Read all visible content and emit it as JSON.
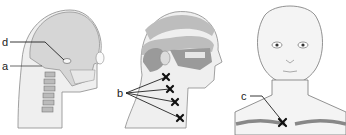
{
  "figure": {
    "panels": [
      {
        "id": "skull-lateral",
        "description": "Lateral view of head with skull and cervical spine",
        "labels": [
          {
            "text": "d",
            "target": "temporomandibular joint"
          },
          {
            "text": "a",
            "target": "occipital / upper cervical region"
          }
        ]
      },
      {
        "id": "head-lateral-pain",
        "description": "Lateral view of head with shaded referred-pain zones and marked neck points",
        "labels": [
          {
            "text": "b",
            "target": "four marked points along the side of the neck"
          }
        ]
      },
      {
        "id": "face-frontal",
        "description": "Frontal view of face and neck with clavicles",
        "labels": [
          {
            "text": "c",
            "target": "point near the sternoclavicular joint"
          }
        ]
      }
    ],
    "label_texts": {
      "a": "a",
      "b": "b",
      "c": "c",
      "d": "d"
    },
    "colors": {
      "skin": "#efefef",
      "bone": "#d6d6d6",
      "shade_dark": "#9a9a9a",
      "shade_mid": "#bdbdbd",
      "line": "#222222",
      "outline": "#8a8a8a"
    }
  }
}
